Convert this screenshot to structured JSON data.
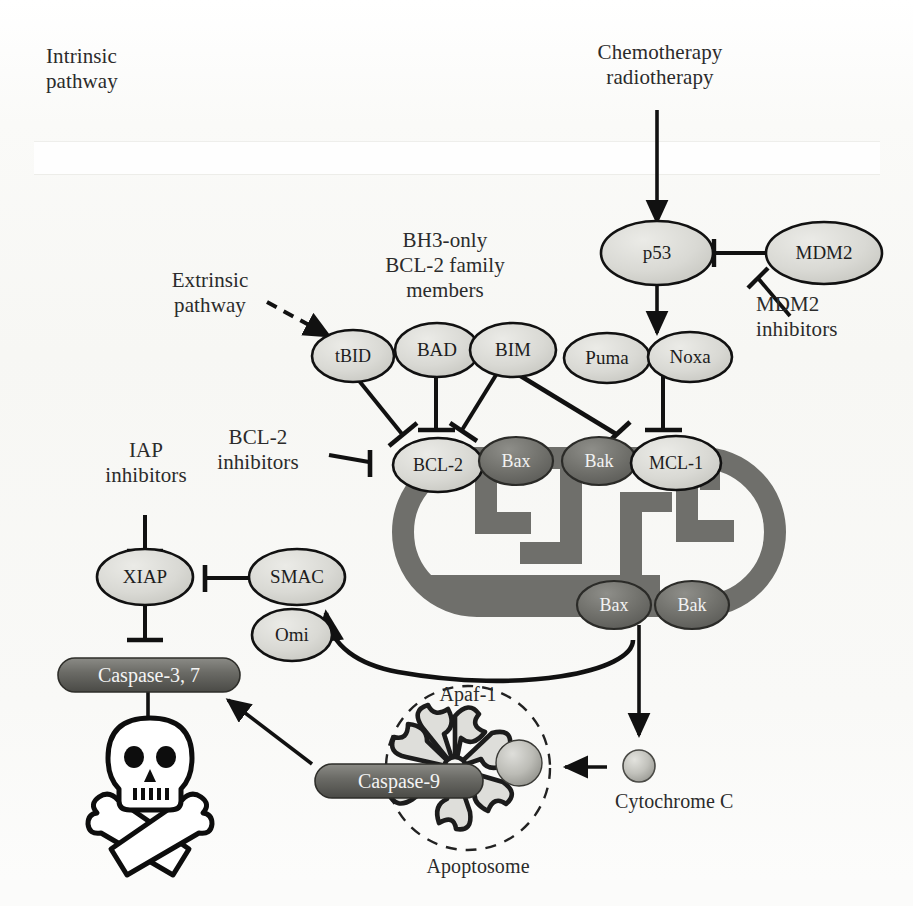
{
  "figure": {
    "kind": "apoptosis-signalling-pathway-diagram",
    "annotations": {
      "intrinsic_pathway": "Intrinsic\npathway",
      "extrinsic_pathway": "Extrinsic\npathway",
      "stimulus": "Chemotherapy\nradiotherapy",
      "bh3_family": "BH3-only\nBCL-2 family\nmembers",
      "mdm2_inhibitors": "MDM2\ninhibitors",
      "bcl2_inhibitors": "BCL-2\ninhibitors",
      "iap_inhibitors": "IAP\ninhibitors",
      "apaf1": "Apaf-1",
      "apoptosome": "Apoptosome",
      "cytochrome_c": "Cytochrome C"
    },
    "nodes": {
      "p53": "p53",
      "mdm2": "MDM2",
      "tbid": "tBID",
      "bad": "BAD",
      "bim": "BIM",
      "puma": "Puma",
      "noxa": "Noxa",
      "bcl2": "BCL-2",
      "bax_top": "Bax",
      "bak_top": "Bak",
      "mcl1": "MCL-1",
      "bax_bottom": "Bax",
      "bak_bottom": "Bak",
      "xiap": "XIAP",
      "smac": "SMAC",
      "omi": "Omi",
      "caspase37": "Caspase-3, 7",
      "caspase9": "Caspase-9"
    },
    "colors": {
      "page_background": "#fbfbfa",
      "stroke": "#111111",
      "light_oval_fill": "#d8d8d4",
      "dark_oval_fill": "#6e6e6a",
      "mitochondrion_fill": "#6f6f6b",
      "capsule_fill": "#5a5a56",
      "cytochrome_fill": "#b8b8b2",
      "membrane_band": "#ffffff"
    }
  }
}
